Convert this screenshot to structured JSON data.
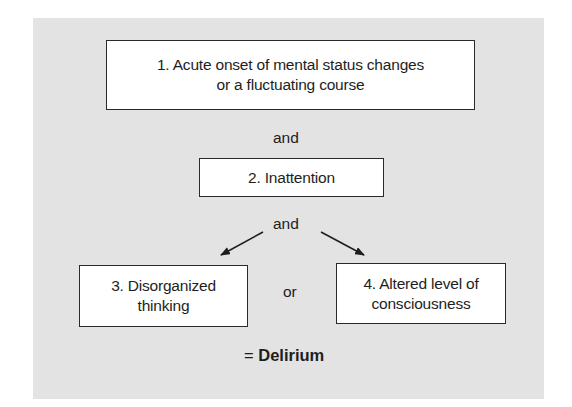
{
  "diagram": {
    "colors": {
      "panel": "#e3e3e3",
      "box": "#ffffff",
      "border": "#2a2a2a",
      "text": "#1e1e1e"
    },
    "criteria": [
      {
        "number": "1.",
        "lines": [
          "1. Acute onset of mental status changes",
          "or a fluctuating course"
        ]
      },
      {
        "number": "2.",
        "lines": [
          "2. Inattention"
        ]
      },
      {
        "number": "3.",
        "lines": [
          "3. Disorganized",
          "thinking"
        ]
      },
      {
        "number": "4.",
        "lines": [
          "4. Altered level of",
          "consciousness"
        ]
      }
    ],
    "connectors": {
      "and_1": "and",
      "and_2": "and",
      "or": "or"
    },
    "result": {
      "equals": "=",
      "label": "Delirium"
    },
    "edges": [
      {
        "from": "criterion-1",
        "to": "criterion-2",
        "label": "and"
      },
      {
        "from": "criterion-2",
        "to": "criterion-3",
        "label": "and",
        "arrow": true
      },
      {
        "from": "criterion-2",
        "to": "criterion-4",
        "label": "and",
        "arrow": true
      },
      {
        "from": "criterion-3",
        "to": "criterion-4",
        "label": "or"
      }
    ]
  }
}
